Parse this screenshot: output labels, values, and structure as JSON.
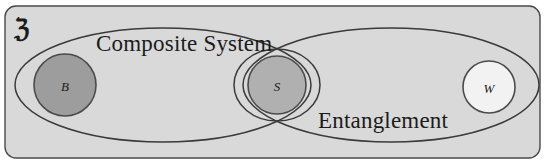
{
  "figure": {
    "type": "venn-diagram",
    "title_symbol": "ℨ",
    "universe_name": "universe-set-U",
    "background_color": "#d9d9d9",
    "stroke_color": "#3a3a3a",
    "labels": {
      "composite_system": "Composite System",
      "entanglement": "Entanglement"
    },
    "nodes": [
      {
        "id": "B",
        "label": "B",
        "fill": "#9d9d9d",
        "cx": 65,
        "cy": 85,
        "r": 31
      },
      {
        "id": "S",
        "label": "S",
        "fill": "#b0b0b0",
        "cx": 277,
        "cy": 85,
        "r": 29
      },
      {
        "id": "W",
        "label": "W",
        "fill": "#f2f2f2",
        "cx": 489,
        "cy": 87,
        "r": 26
      }
    ],
    "sets": [
      {
        "id": "composite-system",
        "label": "Composite System",
        "cx": 163,
        "cy": 85,
        "rx": 148,
        "ry": 57,
        "contains": [
          "B",
          "S"
        ]
      },
      {
        "id": "entanglement",
        "label": "Entanglement",
        "cx": 391,
        "cy": 85,
        "rx": 148,
        "ry": 57,
        "contains": [
          "S",
          "W"
        ]
      },
      {
        "id": "s-inner-ellipse",
        "label": "",
        "cx": 277,
        "cy": 85,
        "rx": 43,
        "ry": 36,
        "contains": [
          "S"
        ]
      }
    ]
  }
}
